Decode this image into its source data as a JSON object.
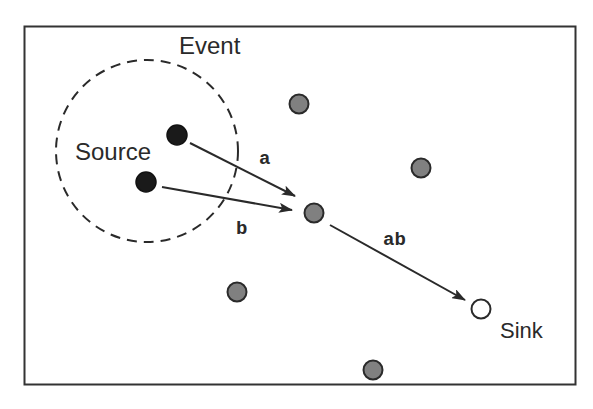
{
  "diagram": {
    "labels": {
      "event": "Event",
      "source": "Source",
      "sink": "Sink",
      "edge_a": "a",
      "edge_b": "b",
      "edge_ab": "ab"
    },
    "colors": {
      "border": "#333333",
      "source_node": "#1a1a1a",
      "relay_node": "#808080",
      "sink_node": "#ffffff",
      "edge": "#2a2a2a"
    },
    "nodes": [
      {
        "id": "source-1",
        "type": "source",
        "x": 177,
        "y": 135
      },
      {
        "id": "source-2",
        "type": "source",
        "x": 146,
        "y": 182
      },
      {
        "id": "relay-aggregator",
        "type": "relay",
        "x": 314,
        "y": 213
      },
      {
        "id": "relay-1",
        "type": "relay",
        "x": 299,
        "y": 104
      },
      {
        "id": "relay-2",
        "type": "relay",
        "x": 421,
        "y": 168
      },
      {
        "id": "relay-3",
        "type": "relay",
        "x": 237,
        "y": 292
      },
      {
        "id": "relay-4",
        "type": "relay",
        "x": 373,
        "y": 370
      },
      {
        "id": "sink",
        "type": "sink",
        "x": 481,
        "y": 309
      }
    ],
    "edges": [
      {
        "from": "source-1",
        "to": "relay-aggregator",
        "label": "a"
      },
      {
        "from": "source-2",
        "to": "relay-aggregator",
        "label": "b"
      },
      {
        "from": "relay-aggregator",
        "to": "sink",
        "label": "ab"
      }
    ]
  }
}
